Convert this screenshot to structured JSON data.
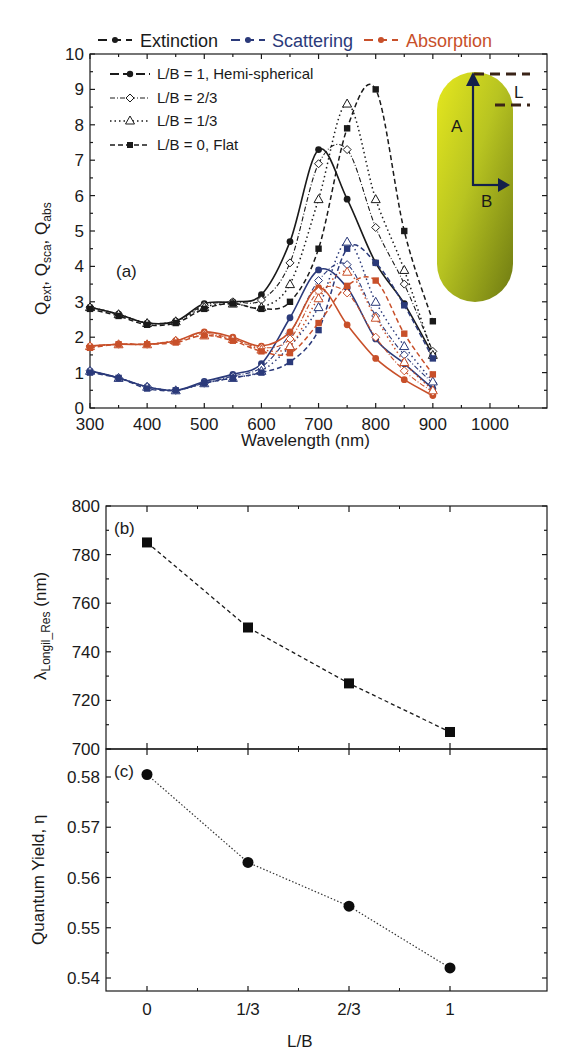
{
  "chart_data": [
    {
      "panel": "(a)",
      "type": "line",
      "title": "",
      "xlabel": "Wavelength (nm)",
      "ylabel": "Q_ext, Q_sca, Q_abs",
      "xlim": [
        300,
        1090
      ],
      "ylim": [
        0,
        10
      ],
      "xticks": [
        300,
        400,
        500,
        600,
        700,
        800,
        900,
        1000
      ],
      "yticks": [
        0,
        1,
        2,
        3,
        4,
        5,
        6,
        7,
        8,
        9,
        10
      ],
      "grid": false,
      "x": [
        300,
        350,
        400,
        450,
        500,
        550,
        600,
        650,
        700,
        750,
        800,
        850,
        900
      ],
      "quantity_legend": [
        {
          "name": "Extinction",
          "color": "#1a1a1a"
        },
        {
          "name": "Scattering",
          "color": "#2b3a7a"
        },
        {
          "name": "Absorption",
          "color": "#c8502a"
        }
      ],
      "shape_legend": [
        {
          "name": "L/B = 1, Hemi-spherical",
          "marker": "filled-circle",
          "dash": "solid"
        },
        {
          "name": "L/B = 2/3",
          "marker": "open-diamond",
          "dash": "dash-dot"
        },
        {
          "name": "L/B = 1/3",
          "marker": "open-triangle",
          "dash": "dotted"
        },
        {
          "name": "L/B = 0, Flat",
          "marker": "filled-square",
          "dash": "dashed"
        }
      ],
      "series": [
        {
          "name": "Extinction, L/B = 1",
          "values": [
            2.85,
            2.65,
            2.4,
            2.45,
            2.95,
            3.0,
            3.2,
            4.7,
            7.3,
            5.9,
            4.1,
            2.95,
            1.5
          ]
        },
        {
          "name": "Extinction, L/B = 2/3",
          "values": [
            2.85,
            2.65,
            2.4,
            2.45,
            2.9,
            3.0,
            3.05,
            4.1,
            6.9,
            7.3,
            5.1,
            3.5,
            1.6
          ]
        },
        {
          "name": "Extinction, L/B = 1/3",
          "values": [
            2.85,
            2.65,
            2.4,
            2.45,
            2.85,
            2.95,
            2.85,
            3.5,
            5.9,
            8.6,
            5.9,
            3.9,
            1.5
          ]
        },
        {
          "name": "Extinction, L/B = 0",
          "values": [
            2.8,
            2.6,
            2.35,
            2.4,
            2.8,
            2.95,
            2.8,
            3.0,
            4.5,
            7.9,
            9.0,
            5.0,
            2.45
          ]
        },
        {
          "name": "Scattering, L/B = 1",
          "values": [
            1.05,
            0.85,
            0.6,
            0.5,
            0.75,
            0.95,
            1.25,
            2.55,
            3.9,
            3.4,
            1.95,
            1.25,
            0.55
          ]
        },
        {
          "name": "Scattering, L/B = 2/3",
          "values": [
            1.05,
            0.85,
            0.6,
            0.5,
            0.7,
            0.9,
            1.15,
            2.1,
            3.6,
            4.05,
            2.6,
            1.5,
            0.7
          ]
        },
        {
          "name": "Scattering, L/B = 1/3",
          "values": [
            1.05,
            0.85,
            0.6,
            0.5,
            0.7,
            0.85,
            1.05,
            1.75,
            2.85,
            4.7,
            3.0,
            1.75,
            0.75
          ]
        },
        {
          "name": "Scattering, L/B = 0",
          "values": [
            1.0,
            0.85,
            0.55,
            0.5,
            0.7,
            0.85,
            1.0,
            1.3,
            2.2,
            4.5,
            4.1,
            2.9,
            1.4
          ]
        },
        {
          "name": "Absorption, L/B = 1",
          "values": [
            1.75,
            1.8,
            1.8,
            1.9,
            2.15,
            2.0,
            1.75,
            2.15,
            3.4,
            2.35,
            1.4,
            0.8,
            0.35
          ]
        },
        {
          "name": "Absorption, L/B = 2/3",
          "values": [
            1.75,
            1.8,
            1.8,
            1.9,
            2.1,
            1.95,
            1.7,
            1.95,
            3.3,
            3.25,
            2.0,
            1.05,
            0.45
          ]
        },
        {
          "name": "Absorption, L/B = 1/3",
          "values": [
            1.75,
            1.8,
            1.8,
            1.9,
            2.05,
            1.95,
            1.65,
            1.75,
            3.1,
            3.85,
            2.55,
            1.3,
            0.5
          ]
        },
        {
          "name": "Absorption, L/B = 0",
          "values": [
            1.7,
            1.8,
            1.8,
            1.85,
            2.05,
            1.9,
            1.6,
            1.55,
            2.4,
            3.45,
            3.6,
            2.1,
            0.95
          ]
        }
      ],
      "annotations": [
        "(a)",
        "A",
        "B",
        "L"
      ],
      "inset": "gold nanorod capsule with axes A (length), B (half-width), L (cap height)"
    },
    {
      "panel": "(b)",
      "type": "line",
      "xlabel": "",
      "ylabel": "λ_Longil_Res (nm)",
      "categories": [
        "0",
        "1/3",
        "2/3",
        "1"
      ],
      "values": [
        785,
        750,
        727,
        707
      ],
      "ylim": [
        700,
        800
      ],
      "yticks": [
        700,
        720,
        740,
        760,
        780,
        800
      ],
      "marker": "filled-square",
      "dash": "dashed",
      "grid": false
    },
    {
      "panel": "(c)",
      "type": "line",
      "xlabel": "L/B",
      "ylabel": "Quantum Yield, η",
      "categories": [
        "0",
        "1/3",
        "2/3",
        "1"
      ],
      "values": [
        0.5805,
        0.563,
        0.5543,
        0.542
      ],
      "ylim": [
        0.5375,
        0.5845
      ],
      "yticks": [
        0.54,
        0.55,
        0.56,
        0.57,
        0.58
      ],
      "marker": "filled-circle",
      "dash": "dotted",
      "grid": false
    }
  ],
  "labels": {
    "panel_a": "(a)",
    "panel_b": "(b)",
    "panel_c": "(c)",
    "legend_extinction": "Extinction",
    "legend_scattering": "Scattering",
    "legend_absorption": "Absorption",
    "legend_lb1": "L/B = 1, Hemi-spherical",
    "legend_lb23": "L/B = 2/3",
    "legend_lb13": "L/B = 1/3",
    "legend_lb0": "L/B = 0, Flat",
    "a_xlabel": "Wavelength (nm)",
    "b_ylabel_main": "λ",
    "b_ylabel_sub": "Longil_Res",
    "b_ylabel_unit": " (nm)",
    "c_ylabel": "Quantum Yield, η",
    "c_xlabel": "L/B",
    "inset_A": "A",
    "inset_B": "B",
    "inset_L": "L",
    "a_ylabel_q1": "Q",
    "a_ylabel_s1": "ext",
    "a_ylabel_q2": ", Q",
    "a_ylabel_s2": "sca",
    "a_ylabel_q3": ", Q",
    "a_ylabel_s3": "abs"
  },
  "colors": {
    "extinction": "#1a1a1a",
    "scattering": "#2b3a7a",
    "absorption": "#c8502a"
  }
}
